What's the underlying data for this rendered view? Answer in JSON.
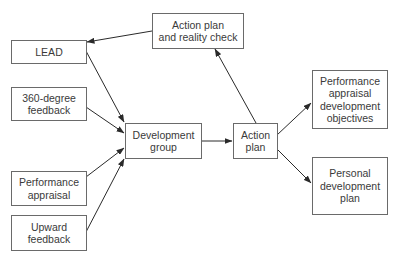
{
  "nodes": {
    "reality_check": {
      "label": "Action plan\nand reality check"
    },
    "lead": {
      "label": "LEAD"
    },
    "feedback_360": {
      "label": "360-degree\nfeedback"
    },
    "perf_appraisal": {
      "label": "Performance\nappraisal"
    },
    "upward_feedback": {
      "label": "Upward\nfeedback"
    },
    "dev_group": {
      "label": "Development\ngroup"
    },
    "action_plan": {
      "label": "Action\nplan"
    },
    "pa_dev_objectives": {
      "label": "Performance\nappraisal\ndevelopment\nobjectives"
    },
    "personal_dev_plan": {
      "label": "Personal\ndevelopment\nplan"
    }
  },
  "edges": [
    {
      "from": "lead",
      "to": "dev_group"
    },
    {
      "from": "feedback_360",
      "to": "dev_group"
    },
    {
      "from": "perf_appraisal",
      "to": "dev_group"
    },
    {
      "from": "upward_feedback",
      "to": "dev_group"
    },
    {
      "from": "dev_group",
      "to": "action_plan"
    },
    {
      "from": "action_plan",
      "to": "reality_check"
    },
    {
      "from": "reality_check",
      "to": "lead"
    },
    {
      "from": "action_plan",
      "to": "pa_dev_objectives"
    },
    {
      "from": "action_plan",
      "to": "personal_dev_plan"
    }
  ]
}
